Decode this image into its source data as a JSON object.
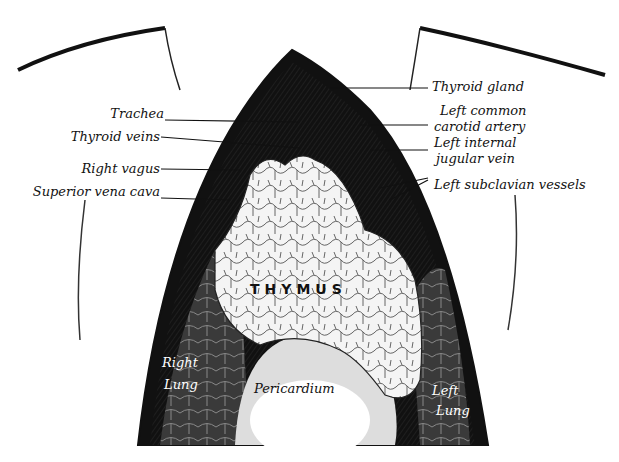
{
  "diagram": {
    "type": "anatomical illustration",
    "labels_left": [
      {
        "id": "trachea",
        "text": "Trachea"
      },
      {
        "id": "thyroid_veins",
        "text": "Thyroid veins"
      },
      {
        "id": "right_vagus",
        "text": "Right vagus"
      },
      {
        "id": "svc",
        "text": "Superior vena cava"
      }
    ],
    "labels_right": [
      {
        "id": "thyroid_gland",
        "text": "Thyroid gland"
      },
      {
        "id": "lcca1",
        "text": "Left common"
      },
      {
        "id": "lcca2",
        "text": "carotid artery"
      },
      {
        "id": "lijv1",
        "text": "Left internal"
      },
      {
        "id": "lijv2",
        "text": "jugular vein"
      },
      {
        "id": "lsv",
        "text": "Left subclavian vessels"
      }
    ],
    "organ_labels": {
      "thymus": "THYMUS",
      "pericardium": "Pericardium",
      "right_lung_1": "Right",
      "right_lung_2": "Lung",
      "left_lung_1": "Left",
      "left_lung_2": "Lung"
    }
  }
}
